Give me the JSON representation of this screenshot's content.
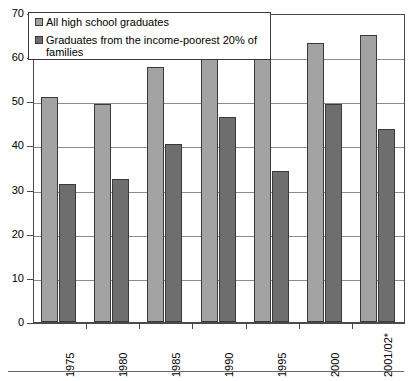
{
  "chart_data": {
    "type": "bar",
    "title": "",
    "xlabel": "",
    "ylabel": "",
    "ylim": [
      0,
      70
    ],
    "ytick_step": 10,
    "yticks": [
      "0",
      "10",
      "20",
      "30",
      "40",
      "50",
      "60",
      "70"
    ],
    "grid": true,
    "legend_position": "top-left-inside",
    "categories": [
      "1975",
      "1980",
      "1985",
      "1990",
      "1995",
      "2000",
      "2001/02*"
    ],
    "series": [
      {
        "name": "All high school graduates",
        "color": "#a3a3a3",
        "values": [
          50.9,
          49.3,
          57.7,
          60.0,
          61.6,
          63.3,
          65.0
        ]
      },
      {
        "name": "Graduates from the income-poorest 20% of families",
        "color": "#6e6e6e",
        "values": [
          31.2,
          32.4,
          40.3,
          46.5,
          34.1,
          49.5,
          43.7
        ]
      }
    ]
  },
  "legend": {
    "entries": [
      {
        "label": "All high school graduates"
      },
      {
        "label": "Graduates from the income-poorest 20% of families"
      }
    ]
  },
  "colors": {
    "series_light": "#a3a3a3",
    "series_dark": "#6e6e6e",
    "axis": "#4a4a4a",
    "grid": "#8c8c8c",
    "background": "#ffffff"
  }
}
